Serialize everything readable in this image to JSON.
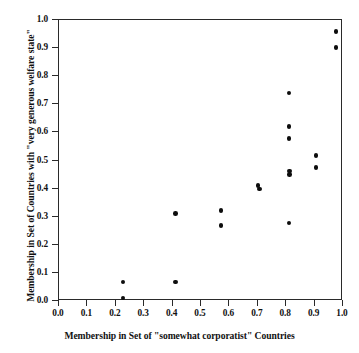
{
  "chart_data": {
    "type": "scatter",
    "title": "",
    "xlabel": "Membership in Set of \"somewhat corporatist\" Countries",
    "ylabel": "Membership in Set of Countries with \"very generous welfare state\"",
    "xlim": [
      0.0,
      1.0
    ],
    "ylim": [
      0.0,
      1.0
    ],
    "grid": false,
    "legend": null,
    "marker": {
      "shape": "circle",
      "color": "#0d0d0d",
      "size": 4.6
    },
    "xticks": [
      "0.0",
      "0.1",
      "0.2",
      "0.3",
      "0.4",
      "0.5",
      "0.6",
      "0.7",
      "0.8",
      "0.9",
      "1.0"
    ],
    "yticks": [
      "0.0",
      "0.1",
      "0.2",
      "0.3",
      "0.4",
      "0.5",
      "0.6",
      "0.7",
      "0.8",
      "0.9",
      "1.0"
    ],
    "xtick_values": [
      0.0,
      0.1,
      0.2,
      0.3,
      0.4,
      0.5,
      0.6,
      0.7,
      0.8,
      0.9,
      1.0
    ],
    "ytick_values": [
      0.0,
      0.1,
      0.2,
      0.3,
      0.4,
      0.5,
      0.6,
      0.7,
      0.8,
      0.9,
      1.0
    ],
    "points": [
      {
        "x": 0.225,
        "y": 0.068
      },
      {
        "x": 0.225,
        "y": 0.01
      },
      {
        "x": 0.41,
        "y": 0.312
      },
      {
        "x": 0.41,
        "y": 0.068
      },
      {
        "x": 0.57,
        "y": 0.322
      },
      {
        "x": 0.57,
        "y": 0.268
      },
      {
        "x": 0.7,
        "y": 0.41
      },
      {
        "x": 0.705,
        "y": 0.398
      },
      {
        "x": 0.81,
        "y": 0.74
      },
      {
        "x": 0.81,
        "y": 0.622
      },
      {
        "x": 0.81,
        "y": 0.578
      },
      {
        "x": 0.812,
        "y": 0.462
      },
      {
        "x": 0.812,
        "y": 0.45
      },
      {
        "x": 0.81,
        "y": 0.278
      },
      {
        "x": 0.905,
        "y": 0.518
      },
      {
        "x": 0.905,
        "y": 0.475
      },
      {
        "x": 0.975,
        "y": 0.96
      },
      {
        "x": 0.975,
        "y": 0.902
      }
    ]
  }
}
